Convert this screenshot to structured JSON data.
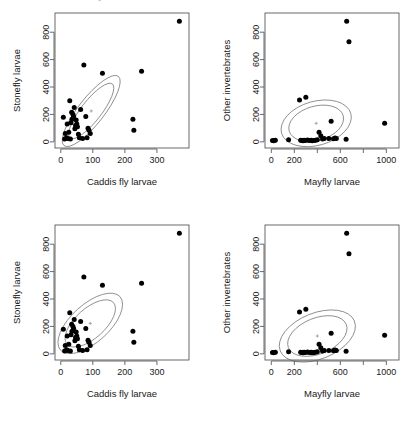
{
  "figure": {
    "cutoff_header_text": "bivariate kernel density contours",
    "layout": "2x2 panel grid",
    "point_color": "#000000",
    "contour_color": "#6e6e6e"
  },
  "chart_data": [
    {
      "type": "scatter",
      "title": "",
      "panel": "top-left",
      "xlabel": "Caddis fly larvae",
      "ylabel": "Stonefly larvae",
      "xlim": [
        -18,
        400
      ],
      "ylim": [
        -45,
        940
      ],
      "xticks": [
        0,
        100,
        200,
        300
      ],
      "yticks": [
        0,
        200,
        400,
        600,
        800
      ],
      "grid": false,
      "legend": "none",
      "annotations": [
        "bivariate normal density contours, 2 levels",
        "center cross marker"
      ],
      "contour_style": "narrow elongated positively-tilted",
      "center": [
        95,
        225
      ],
      "x": [
        8,
        12,
        14,
        18,
        20,
        22,
        25,
        28,
        30,
        32,
        34,
        35,
        38,
        40,
        42,
        44,
        46,
        48,
        50,
        52,
        55,
        58,
        62,
        68,
        72,
        78,
        82,
        85,
        88,
        92,
        130,
        225,
        228,
        252,
        370
      ],
      "y": [
        180,
        20,
        60,
        30,
        130,
        25,
        70,
        300,
        20,
        140,
        215,
        165,
        200,
        185,
        250,
        95,
        120,
        160,
        130,
        110,
        55,
        30,
        235,
        25,
        560,
        185,
        30,
        100,
        85,
        60,
        500,
        165,
        85,
        515,
        880
      ]
    },
    {
      "type": "scatter",
      "title": "",
      "panel": "top-right",
      "xlabel": "Mayfly larvae",
      "ylabel": "Other invertebrates",
      "xlim": [
        -55,
        1110
      ],
      "ylim": [
        -45,
        940
      ],
      "xticks": [
        0,
        200,
        400,
        600,
        800,
        1000
      ],
      "xticklabels": [
        "0",
        "200",
        "",
        "600",
        "",
        "1000"
      ],
      "yticks": [
        0,
        200,
        400,
        600,
        800
      ],
      "grid": false,
      "legend": "none",
      "annotations": [
        "bivariate normal density contours, 2 levels",
        "center cross marker"
      ],
      "contour_style": "rounded blob, slight positive tilt",
      "center": [
        390,
        135
      ],
      "x": [
        10,
        20,
        35,
        150,
        245,
        255,
        265,
        275,
        285,
        295,
        300,
        315,
        330,
        345,
        355,
        370,
        385,
        400,
        415,
        430,
        445,
        460,
        500,
        520,
        540,
        555,
        565,
        650,
        655,
        675,
        985
      ],
      "y": [
        10,
        8,
        12,
        15,
        305,
        12,
        10,
        8,
        12,
        10,
        325,
        14,
        10,
        12,
        8,
        10,
        12,
        15,
        70,
        45,
        20,
        25,
        25,
        150,
        22,
        28,
        25,
        18,
        880,
        730,
        135
      ]
    },
    {
      "type": "scatter",
      "title": "",
      "panel": "bottom-left",
      "xlabel": "Caddis fly larvae",
      "ylabel": "Stonefly larvae",
      "xlim": [
        -18,
        400
      ],
      "ylim": [
        -45,
        940
      ],
      "xticks": [
        0,
        100,
        200,
        300
      ],
      "yticks": [
        0,
        200,
        400,
        600,
        800
      ],
      "grid": false,
      "legend": "none",
      "annotations": [
        "bivariate normal density contours, 2 levels",
        "center cross marker"
      ],
      "contour_style": "wide tilted ellipses",
      "center": [
        92,
        222
      ],
      "x": [
        8,
        12,
        14,
        18,
        20,
        22,
        25,
        28,
        30,
        32,
        34,
        35,
        38,
        40,
        42,
        44,
        46,
        48,
        50,
        52,
        55,
        58,
        62,
        68,
        72,
        78,
        82,
        85,
        88,
        92,
        130,
        225,
        228,
        252,
        370
      ],
      "y": [
        180,
        20,
        60,
        30,
        130,
        25,
        70,
        300,
        20,
        140,
        215,
        165,
        200,
        185,
        250,
        95,
        120,
        160,
        130,
        110,
        55,
        30,
        235,
        25,
        560,
        185,
        30,
        100,
        85,
        60,
        500,
        165,
        85,
        515,
        880
      ]
    },
    {
      "type": "scatter",
      "title": "",
      "panel": "bottom-right",
      "xlabel": "Mayfly larvae",
      "ylabel": "Other invertebrates",
      "xlim": [
        -55,
        1110
      ],
      "ylim": [
        -45,
        940
      ],
      "xticks": [
        0,
        200,
        400,
        600,
        800,
        1000
      ],
      "xticklabels": [
        "0",
        "200",
        "",
        "600",
        "",
        "1000"
      ],
      "yticks": [
        0,
        200,
        400,
        600,
        800
      ],
      "grid": false,
      "legend": "none",
      "annotations": [
        "bivariate normal density contours, 2 levels",
        "center cross marker"
      ],
      "contour_style": "wide tilted ellipses",
      "center": [
        400,
        130
      ],
      "x": [
        10,
        20,
        35,
        150,
        245,
        255,
        265,
        275,
        285,
        295,
        300,
        315,
        330,
        345,
        355,
        370,
        385,
        400,
        415,
        430,
        445,
        460,
        500,
        520,
        540,
        555,
        565,
        650,
        655,
        675,
        985
      ],
      "y": [
        10,
        8,
        12,
        15,
        305,
        12,
        10,
        8,
        12,
        10,
        325,
        14,
        10,
        12,
        8,
        10,
        12,
        15,
        70,
        45,
        20,
        25,
        25,
        150,
        22,
        28,
        25,
        18,
        880,
        730,
        135
      ]
    }
  ]
}
